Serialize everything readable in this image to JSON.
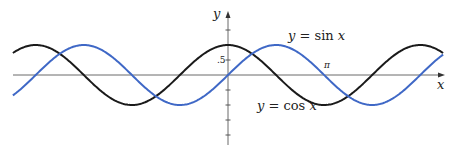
{
  "chart_data": {
    "type": "line",
    "title": "",
    "xlabel": "x",
    "ylabel": "y",
    "xlim": [
      -7.03,
      7.03
    ],
    "ylim": [
      -2.0,
      2.0
    ],
    "grid": false,
    "legend": "inline labels on curves",
    "series": [
      {
        "name": "y = sin x",
        "function": "sin",
        "color": "#3f68c6",
        "x": [
          -6.2832,
          -4.7124,
          -3.1416,
          -1.5708,
          0,
          1.5708,
          3.1416,
          4.7124,
          6.2832
        ],
        "y": [
          0,
          1,
          0,
          -1,
          0,
          1,
          0,
          -1,
          0
        ]
      },
      {
        "name": "y = cos x",
        "function": "cos",
        "color": "#1a1a1a",
        "x": [
          -6.2832,
          -4.7124,
          -3.1416,
          -1.5708,
          0,
          1.5708,
          3.1416,
          4.7124,
          6.2832
        ],
        "y": [
          1,
          0,
          -1,
          0,
          1,
          0,
          -1,
          0,
          1
        ]
      }
    ],
    "y_ticks": [
      1.5,
      1.0,
      0.5,
      -0.5,
      -1.0,
      -1.5,
      -2.0
    ],
    "annotations": [
      {
        "text": ".5",
        "at": "y-axis tick 0.5"
      },
      {
        "text": "π",
        "at": "x-axis near x = π"
      }
    ]
  },
  "labels": {
    "x_axis": "x",
    "y_axis": "y",
    "sin_label_y": "y",
    "sin_label_eq": " = sin ",
    "sin_label_x": "x",
    "cos_label_y": "y",
    "cos_label_eq": " = cos ",
    "cos_label_x": "x",
    "half_tick": ".5",
    "pi_tick": "π"
  },
  "colors": {
    "sin": "#3f68c6",
    "cos": "#1a1a1a",
    "axis": "#6a6a6a"
  }
}
